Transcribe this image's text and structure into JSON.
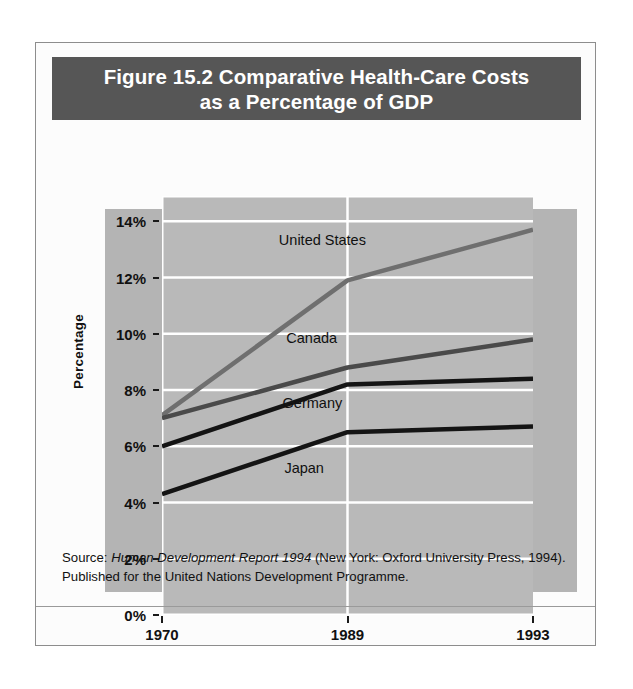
{
  "figure": {
    "title_line1": "Figure 15.2  Comparative Health-Care Costs",
    "title_line2": "as a Percentage of GDP",
    "source_prefix": "Source: ",
    "source_italic": "Human Development Report 1994",
    "source_rest": " (New York: Oxford University Press, 1994). Published for the United Nations Development Programme."
  },
  "chart_data": {
    "type": "line",
    "title": "Figure 15.2  Comparative Health-Care Costs as a Percentage of GDP",
    "xlabel": "",
    "ylabel": "Percentage",
    "x": [
      "1970",
      "1989",
      "1993"
    ],
    "xtick_labels": [
      "1970",
      "1989",
      "1993"
    ],
    "ytick_labels": [
      "14%",
      "12%",
      "10%",
      "8%",
      "6%",
      "4%",
      "2%",
      "0%"
    ],
    "ytick_values": [
      14,
      12,
      10,
      8,
      6,
      4,
      2,
      0
    ],
    "ylim": [
      0,
      14.9
    ],
    "grid": true,
    "grid_color": "#ffffff",
    "plot_background": "#b9b9b9",
    "legend_position": "inline-labels",
    "series": [
      {
        "name": "United States",
        "values": [
          7.1,
          11.9,
          13.7
        ],
        "color": "#6f6f6f",
        "label_x_pct": 31.5,
        "label_y_pct": 8.5
      },
      {
        "name": "Canada",
        "values": [
          7.0,
          8.8,
          9.8
        ],
        "color": "#4a4a4a",
        "label_x_pct": 33.5,
        "label_y_pct": 32.0
      },
      {
        "name": "Germany",
        "values": [
          6.0,
          8.2,
          8.4
        ],
        "color": "#141414",
        "label_x_pct": 32.5,
        "label_y_pct": 47.5
      },
      {
        "name": "Japan",
        "values": [
          4.3,
          6.5,
          6.7
        ],
        "color": "#141414",
        "label_x_pct": 33.0,
        "label_y_pct": 63.0
      }
    ]
  }
}
